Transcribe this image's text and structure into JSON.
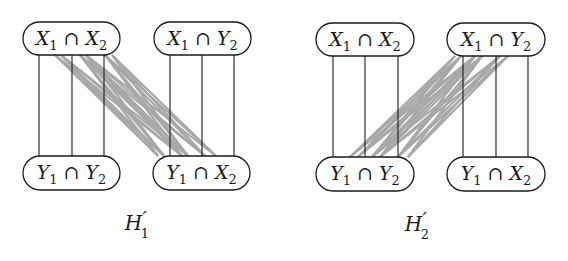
{
  "diagrams": [
    {
      "id": "H1",
      "caption": {
        "base": "H",
        "prime": "′",
        "sub": "1",
        "x": 137,
        "y": 230
      },
      "nodes": [
        {
          "id": "tl",
          "label": [
            "X",
            "1",
            " ∩ ",
            "X",
            "2"
          ],
          "x": 23,
          "y": 22,
          "w": 97,
          "h": 33
        },
        {
          "id": "tr",
          "label": [
            "X",
            "1",
            " ∩ ",
            "Y",
            "2"
          ],
          "x": 154,
          "y": 22,
          "w": 97,
          "h": 33
        },
        {
          "id": "bl",
          "label": [
            "Y",
            "1",
            " ∩ ",
            "Y",
            "2"
          ],
          "x": 23,
          "y": 156,
          "w": 97,
          "h": 34
        },
        {
          "id": "br",
          "label": [
            "Y",
            "1",
            " ∩ ",
            "X",
            "2"
          ],
          "x": 153,
          "y": 156,
          "w": 97,
          "h": 34
        }
      ],
      "black_edges": [
        {
          "x": 39,
          "y1": 55,
          "y2": 156
        },
        {
          "x": 72,
          "y1": 55,
          "y2": 156
        },
        {
          "x": 104,
          "y1": 55,
          "y2": 156
        },
        {
          "x": 170,
          "y1": 55,
          "y2": 156
        },
        {
          "x": 202,
          "y1": 55,
          "y2": 156
        },
        {
          "x": 234,
          "y1": 55,
          "y2": 156
        }
      ],
      "gray_edges": {
        "y1": 55,
        "y2": 156,
        "from_x": [
          55,
          61,
          80,
          86,
          105,
          112
        ],
        "to_x": [
          158,
          164,
          182,
          188,
          205,
          216
        ]
      }
    },
    {
      "id": "H2",
      "caption": {
        "base": "H",
        "prime": "′",
        "sub": "2",
        "x": 417,
        "y": 231
      },
      "nodes": [
        {
          "id": "tl",
          "label": [
            "X",
            "1",
            " ∩ ",
            "X",
            "2"
          ],
          "x": 316,
          "y": 23,
          "w": 98,
          "h": 33
        },
        {
          "id": "tr",
          "label": [
            "X",
            "1",
            " ∩ ",
            "Y",
            "2"
          ],
          "x": 447,
          "y": 23,
          "w": 98,
          "h": 33
        },
        {
          "id": "bl",
          "label": [
            "Y",
            "1",
            " ∩ ",
            "Y",
            "2"
          ],
          "x": 316,
          "y": 157,
          "w": 98,
          "h": 34
        },
        {
          "id": "br",
          "label": [
            "Y",
            "1",
            " ∩ ",
            "X",
            "2"
          ],
          "x": 447,
          "y": 157,
          "w": 98,
          "h": 34
        }
      ],
      "black_edges": [
        {
          "x": 333,
          "y1": 56,
          "y2": 157
        },
        {
          "x": 365,
          "y1": 56,
          "y2": 157
        },
        {
          "x": 398,
          "y1": 56,
          "y2": 157
        },
        {
          "x": 463,
          "y1": 56,
          "y2": 157
        },
        {
          "x": 496,
          "y1": 56,
          "y2": 157
        },
        {
          "x": 528,
          "y1": 56,
          "y2": 157
        }
      ],
      "gray_edges": {
        "y1": 56,
        "y2": 157,
        "from_x": [
          455,
          461,
          475,
          482,
          500,
          508
        ],
        "to_x": [
          350,
          358,
          372,
          380,
          398,
          408
        ]
      }
    }
  ],
  "colors": {
    "stroke": "#1a1a1a",
    "gray_edge": "#a8a8a8",
    "background": "#ffffff"
  }
}
